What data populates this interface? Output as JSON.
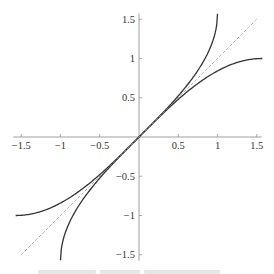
{
  "chart_data": {
    "type": "line",
    "title": "",
    "xlabel": "",
    "ylabel": "",
    "xlim": [
      -1.55,
      1.55
    ],
    "ylim": [
      -1.55,
      1.55
    ],
    "grid": false,
    "legend": null,
    "x_ticks": [
      -1.5,
      -1,
      -0.5,
      0.5,
      1,
      1.5
    ],
    "x_tick_labels": [
      "−1.5",
      "−1",
      "−0.5",
      "0.5",
      "1",
      "1.5"
    ],
    "y_ticks": [
      1.5,
      1,
      0.5,
      -0.5,
      -1,
      -1.5
    ],
    "y_tick_labels": [
      "1.5",
      "1",
      "0.5",
      "−0.5",
      "−1",
      "−1.5"
    ],
    "series": [
      {
        "name": "arcsin(x)",
        "style": "solid",
        "domain": [
          -1,
          1
        ],
        "x": [
          -1,
          -0.9,
          -0.75,
          -0.5,
          -0.25,
          0,
          0.25,
          0.5,
          0.75,
          0.9,
          1
        ],
        "y": [
          -1.571,
          -1.12,
          -0.848,
          -0.524,
          -0.253,
          0,
          0.253,
          0.524,
          0.848,
          1.12,
          1.571
        ]
      },
      {
        "name": "sin(x)",
        "style": "solid",
        "domain": [
          -1.571,
          1.571
        ],
        "x": [
          -1.571,
          -1.25,
          -1,
          -0.5,
          0,
          0.5,
          1,
          1.25,
          1.571
        ],
        "y": [
          -1,
          -0.949,
          -0.841,
          -0.479,
          0,
          0.479,
          0.841,
          0.949,
          1
        ]
      },
      {
        "name": "y = x",
        "style": "dashed",
        "domain": [
          -1.5,
          1.5
        ],
        "x": [
          -1.5,
          1.5
        ],
        "y": [
          -1.5,
          1.5
        ]
      }
    ]
  },
  "colors": {
    "axis": "#888888",
    "curve": "#333333",
    "dashed": "#999999",
    "text": "#333333"
  }
}
